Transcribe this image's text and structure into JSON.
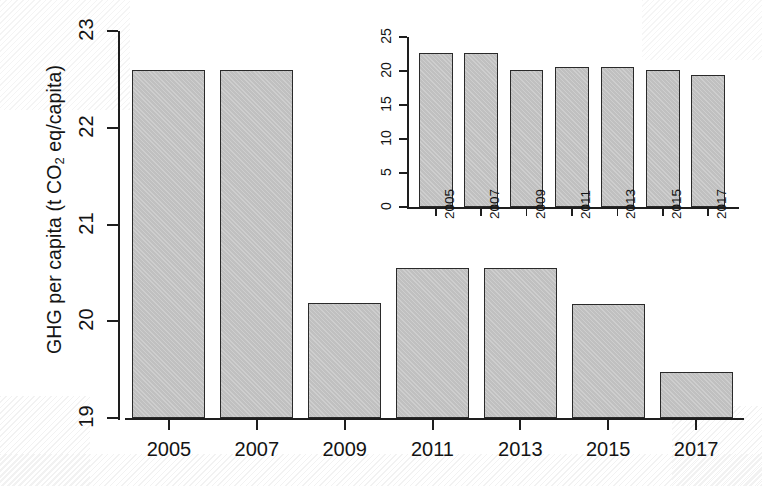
{
  "figure": {
    "background_color": "#ffffff",
    "bar_fill_color": "#c2c2c2",
    "bar_border_color": "#2a2a2a",
    "axis_color": "#1e1e1e",
    "text_color": "#141414"
  },
  "chart_data": [
    {
      "id": "main",
      "type": "bar",
      "title": "",
      "xlabel": "",
      "ylabel": "GHG per capita (t CO2 eq/capita)",
      "ylabel_parts": {
        "prefix": "GHG per capita (t CO",
        "sub": "2",
        "suffix": " eq/capita)"
      },
      "categories": [
        "2005",
        "2007",
        "2009",
        "2011",
        "2013",
        "2015",
        "2017"
      ],
      "values": [
        22.6,
        22.6,
        20.19,
        20.55,
        20.55,
        20.18,
        19.48
      ],
      "ylim": [
        19,
        23
      ],
      "yticks": [
        19,
        20,
        21,
        22,
        23
      ],
      "ytick_labels": [
        "19",
        "20",
        "21",
        "22",
        "23"
      ],
      "grid": false,
      "legend": false
    },
    {
      "id": "inset",
      "type": "bar",
      "title": "",
      "xlabel": "",
      "ylabel": "",
      "categories": [
        "2005",
        "2007",
        "2009",
        "2011",
        "2013",
        "2015",
        "2017"
      ],
      "values": [
        22.6,
        22.6,
        20.19,
        20.55,
        20.55,
        20.18,
        19.48
      ],
      "ylim": [
        0,
        25
      ],
      "yticks": [
        0,
        5,
        10,
        15,
        20,
        25
      ],
      "ytick_labels": [
        "0",
        "5",
        "10",
        "15",
        "20",
        "25"
      ],
      "grid": false,
      "legend": false
    }
  ]
}
